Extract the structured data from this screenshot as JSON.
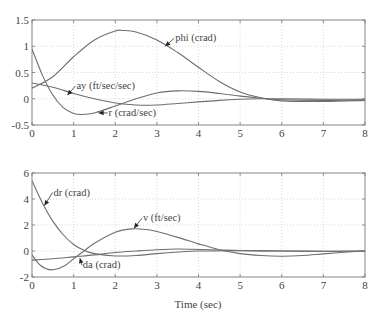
{
  "chart_data": [
    {
      "type": "line",
      "title": "",
      "xlabel": "",
      "ylabel": "",
      "xlim": [
        0,
        8
      ],
      "ylim": [
        -0.5,
        1.5
      ],
      "grid": true,
      "xticks": [
        "0",
        "1",
        "2",
        "3",
        "4",
        "5",
        "6",
        "7",
        "8"
      ],
      "yticks": [
        "-0.5",
        "0",
        "0.5",
        "1",
        "1.5"
      ],
      "series": [
        {
          "name": "phi (crad)",
          "x": [
            0,
            0.5,
            1,
            1.5,
            2,
            2.2,
            2.5,
            3,
            3.5,
            4,
            4.5,
            5,
            5.5,
            6,
            7,
            8
          ],
          "y": [
            0.2,
            0.42,
            0.8,
            1.12,
            1.29,
            1.3,
            1.27,
            1.12,
            0.88,
            0.6,
            0.33,
            0.13,
            0.02,
            -0.04,
            -0.05,
            -0.03
          ]
        },
        {
          "name": "r (crad/sec)",
          "x": [
            0,
            0.25,
            0.5,
            0.75,
            1,
            1.2,
            1.5,
            2,
            2.5,
            3,
            3.5,
            4,
            4.5,
            5,
            5.5,
            6,
            7,
            8
          ],
          "y": [
            0.95,
            0.45,
            0.07,
            -0.17,
            -0.28,
            -0.3,
            -0.27,
            -0.14,
            0.0,
            0.11,
            0.15,
            0.14,
            0.1,
            0.05,
            0.01,
            -0.02,
            -0.03,
            -0.02
          ]
        },
        {
          "name": "ay (ft/sec/sec)",
          "x": [
            0,
            0.5,
            1,
            1.5,
            2,
            2.5,
            3,
            3.5,
            4,
            4.5,
            5,
            5.5,
            6,
            7,
            8
          ],
          "y": [
            0.3,
            0.22,
            0.1,
            0.0,
            -0.08,
            -0.12,
            -0.12,
            -0.09,
            -0.06,
            -0.03,
            -0.01,
            0.0,
            0.0,
            -0.01,
            -0.01
          ]
        }
      ],
      "annotations": [
        {
          "text": "phi (crad)",
          "x": 3.2,
          "y": 1.0
        },
        {
          "text": "ay (ft/sec/sec)",
          "x": 0.85,
          "y": 0.07
        },
        {
          "text": "r (crad/sec)",
          "x": 1.6,
          "y": -0.27
        }
      ]
    },
    {
      "type": "line",
      "title": "",
      "xlabel": "Time (sec)",
      "ylabel": "",
      "xlim": [
        0,
        8
      ],
      "ylim": [
        -2,
        6
      ],
      "grid": true,
      "xticks": [
        "0",
        "1",
        "2",
        "3",
        "4",
        "5",
        "6",
        "7",
        "8"
      ],
      "yticks": [
        "-2",
        "0",
        "2",
        "4",
        "6"
      ],
      "series": [
        {
          "name": "dr (crad)",
          "x": [
            0,
            0.25,
            0.5,
            0.75,
            1,
            1.25,
            1.5,
            2,
            2.5,
            3,
            3.5,
            4,
            5,
            6,
            7,
            8
          ],
          "y": [
            5.4,
            3.7,
            2.3,
            1.25,
            0.5,
            0.05,
            -0.2,
            -0.38,
            -0.35,
            -0.2,
            -0.08,
            0.0,
            0.02,
            0.0,
            -0.02,
            0.0
          ]
        },
        {
          "name": "v (ft/sec)",
          "x": [
            0,
            0.2,
            0.45,
            0.75,
            1,
            1.25,
            1.5,
            2,
            2.4,
            2.75,
            3,
            3.5,
            4,
            4.5,
            5,
            5.5,
            6,
            6.5,
            7,
            7.5,
            8
          ],
          "y": [
            -0.3,
            -1.1,
            -1.45,
            -1.2,
            -0.6,
            0.0,
            0.6,
            1.45,
            1.7,
            1.65,
            1.5,
            1.05,
            0.55,
            0.1,
            -0.2,
            -0.35,
            -0.4,
            -0.35,
            -0.22,
            -0.1,
            0.0
          ]
        },
        {
          "name": "da (crad)",
          "x": [
            0,
            0.5,
            1,
            1.5,
            2,
            2.5,
            3,
            3.5,
            4,
            4.5,
            5,
            6,
            7,
            8
          ],
          "y": [
            -0.7,
            -0.6,
            -0.45,
            -0.3,
            -0.12,
            0.0,
            0.1,
            0.15,
            0.12,
            0.08,
            0.04,
            0.0,
            -0.02,
            0.0
          ]
        }
      ],
      "annotations": [
        {
          "text": "dr (crad)",
          "x": 0.3,
          "y": 3.5
        },
        {
          "text": "v (ft/sec)",
          "x": 2.45,
          "y": 1.75
        },
        {
          "text": "da (crad)",
          "x": 1.15,
          "y": -0.55
        }
      ]
    }
  ]
}
